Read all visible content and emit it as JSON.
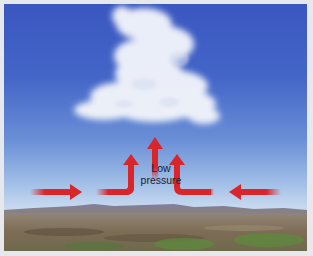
{
  "diagram": {
    "label_line1": "Low",
    "label_line2": "pressure",
    "elements": {
      "sky": "blue-gradient-sky",
      "cloud": "cumulus-cloud",
      "ground": "landscape-with-hills",
      "arrows": [
        {
          "id": "left-inflow",
          "direction": "right"
        },
        {
          "id": "left-bend-up",
          "direction": "right-then-up"
        },
        {
          "id": "center-up",
          "direction": "up"
        },
        {
          "id": "right-bend-up",
          "direction": "left-then-up"
        },
        {
          "id": "right-inflow",
          "direction": "left"
        }
      ]
    },
    "colors": {
      "arrow": "#d8262a",
      "sky_top": "#3a57c0",
      "sky_horizon": "#c6d8ef",
      "frame": "#e6e8ee",
      "label": "#1c2030"
    }
  }
}
